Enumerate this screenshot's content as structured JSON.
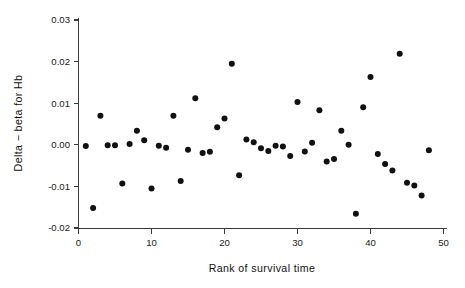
{
  "chart_data": {
    "type": "scatter",
    "title": "",
    "xlabel": "Rank of survival time",
    "ylabel": "Delta - beta for Hb",
    "xlim": [
      0,
      50
    ],
    "ylim": [
      -0.02,
      0.03
    ],
    "xticks": [
      0,
      10,
      20,
      30,
      40,
      50
    ],
    "xtick_labels": [
      "0",
      "10",
      "20",
      "30",
      "40",
      "50"
    ],
    "yticks": [
      -0.02,
      -0.01,
      0.0,
      0.01,
      0.02,
      0.03
    ],
    "ytick_labels": [
      "-0.02",
      "-0.01",
      "0.00",
      "0.01",
      "0.02",
      "0.03"
    ],
    "grid": false,
    "legend": null,
    "marker": "filled-circle",
    "marker_color": "#111111",
    "marker_size": 3.0,
    "series": [
      {
        "name": "Delta-beta for Hb",
        "x": [
          1,
          2,
          3,
          4,
          5,
          6,
          7,
          8,
          9,
          10,
          11,
          12,
          13,
          14,
          15,
          16,
          17,
          18,
          19,
          20,
          21,
          22,
          23,
          24,
          25,
          26,
          27,
          28,
          29,
          30,
          31,
          32,
          33,
          34,
          35,
          36,
          37,
          38,
          39,
          40,
          41,
          42,
          43,
          44,
          45,
          46,
          47,
          48
        ],
        "y": [
          -0.0003,
          -0.0152,
          0.007,
          -0.0001,
          -0.0001,
          -0.0093,
          0.0002,
          0.0034,
          0.0011,
          -0.0105,
          -0.0002,
          -0.0007,
          0.007,
          -0.0087,
          -0.0012,
          0.0112,
          -0.002,
          -0.0017,
          0.0042,
          0.0063,
          0.0195,
          -0.0073,
          0.0013,
          0.0006,
          -0.0008,
          -0.0015,
          -0.0002,
          -0.0004,
          -0.0027,
          0.0103,
          -0.0016,
          0.0005,
          0.0083,
          -0.004,
          -0.0034,
          0.0034,
          0.0,
          -0.0166,
          0.009,
          0.0163,
          -0.0022,
          -0.0046,
          -0.0062,
          0.0219,
          -0.0091,
          -0.0098,
          -0.0122,
          -0.0013
        ]
      }
    ]
  },
  "axes": {
    "y_label_text": "Delta − beta for Hb",
    "x_label_text": "Rank of survival time"
  }
}
